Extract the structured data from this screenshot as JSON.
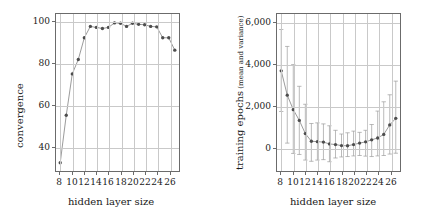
{
  "figure": {
    "background": "#ffffff",
    "marker_color": "#4d4d4d",
    "line_color": "#808080",
    "grid_color": "#c9c9c9",
    "frame_color": "#6b6b6b",
    "errorbar_color": "#9a9a9a"
  },
  "chart_data": [
    {
      "type": "line",
      "panel": "left",
      "title": "",
      "xlabel": "hidden layer size",
      "ylabel": "convergence",
      "xlim": [
        7.3,
        27.7
      ],
      "ylim": [
        28,
        104
      ],
      "grid": true,
      "legend": "none",
      "xticks": [
        8,
        10,
        12,
        14,
        16,
        18,
        20,
        22,
        24,
        26
      ],
      "xtick_labels": [
        "8",
        "10",
        "12",
        "14",
        "16",
        "18",
        "20",
        "22",
        "24",
        "26"
      ],
      "yticks": [
        40,
        60,
        80,
        100
      ],
      "ytick_labels": [
        "40",
        "60",
        "80",
        "100"
      ],
      "x": [
        8,
        9,
        10,
        11,
        12,
        13,
        14,
        15,
        16,
        17,
        18,
        19,
        20,
        21,
        22,
        23,
        24,
        25,
        26,
        27
      ],
      "values": [
        32,
        55,
        75,
        82,
        92.5,
        98,
        97.5,
        97,
        97.5,
        99.7,
        99.5,
        98,
        99.5,
        99,
        98.8,
        98,
        97.8,
        92.5,
        92.5,
        86.5
      ]
    },
    {
      "type": "line",
      "panel": "right",
      "title": "",
      "xlabel": "hidden layer size",
      "ylabel": "training epochs (mean and variance)",
      "ylabel_main": "training epochs",
      "ylabel_sub": "(mean and variance)",
      "xlim": [
        7.3,
        27.7
      ],
      "ylim": [
        -1150,
        6450
      ],
      "grid": true,
      "legend": "none",
      "xticks": [
        8,
        10,
        12,
        14,
        16,
        18,
        20,
        22,
        24,
        26
      ],
      "xtick_labels": [
        "8",
        "10",
        "12",
        "14",
        "16",
        "18",
        "20",
        "22",
        "24",
        "26"
      ],
      "yticks": [
        0,
        2000,
        4000,
        6000
      ],
      "ytick_labels": [
        "0",
        "2,000",
        "4,000",
        "6,000"
      ],
      "x": [
        8,
        9,
        10,
        11,
        12,
        13,
        14,
        15,
        16,
        17,
        18,
        19,
        20,
        21,
        22,
        23,
        24,
        25,
        26,
        27
      ],
      "values": [
        3700,
        2520,
        1820,
        1300,
        660,
        290,
        270,
        250,
        160,
        130,
        80,
        70,
        130,
        200,
        260,
        360,
        450,
        620,
        1080,
        1400
      ],
      "error_low": [
        1730,
        200,
        -300,
        -350,
        -620,
        -680,
        -620,
        -600,
        -700,
        -520,
        -470,
        -450,
        -420,
        -400,
        -430,
        -450,
        -420,
        -400,
        -330,
        -290
      ],
      "error_high": [
        5700,
        4880,
        4000,
        2950,
        2080,
        1150,
        1180,
        1130,
        1040,
        820,
        640,
        700,
        780,
        720,
        820,
        1100,
        1750,
        2200,
        2540,
        3200
      ]
    }
  ]
}
